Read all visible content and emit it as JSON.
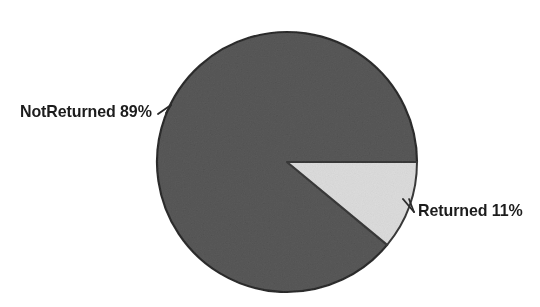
{
  "chart_data": {
    "type": "pie",
    "title": "",
    "subtitle": "",
    "xlabel": "",
    "ylabel": "",
    "legend_position": "none",
    "grid": false,
    "total": 100,
    "units": "percent",
    "start_angle_deg": 0,
    "direction": "clockwise",
    "categories": [
      "Returned",
      "NotReturned"
    ],
    "values": [
      11,
      89
    ],
    "labels": [
      "Returned 11%",
      "NotReturned 89%"
    ],
    "colors": [
      "#dcdcdc",
      "#5a5a5a"
    ],
    "slices": [
      {
        "name": "Returned",
        "value": 11,
        "value_text": "11%",
        "label": "Returned 11%",
        "color": "#dcdcdc",
        "outline": "#3a3a3a",
        "start_angle_deg": 0,
        "end_angle_deg": 39.6
      },
      {
        "name": "NotReturned",
        "value": 89,
        "value_text": "89%",
        "label": "NotReturned 89%",
        "color": "#5a5a5a",
        "outline": "#2e2e2e",
        "start_angle_deg": 39.6,
        "end_angle_deg": 360
      }
    ]
  },
  "geometry": {
    "center_x": 287,
    "center_y": 162,
    "radius": 130
  },
  "palette": {
    "background": "#ffffff",
    "dark_slice": "#5a5a5a",
    "light_slice": "#dcdcdc",
    "outline": "#2e2e2e",
    "text": "#1c1c1c",
    "leader": "#2a2a2a"
  }
}
